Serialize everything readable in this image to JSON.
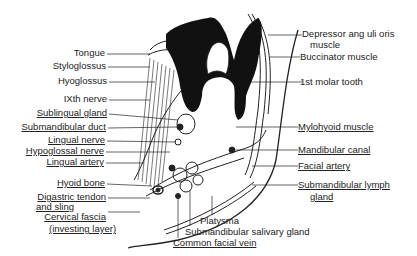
{
  "diagram": {
    "type": "anatomical cross-section",
    "labels_left": [
      {
        "id": "tongue",
        "text": "Tongue"
      },
      {
        "id": "styloglossus",
        "text": "Styloglossus"
      },
      {
        "id": "hyoglossus",
        "text": "Hyoglossus"
      },
      {
        "id": "ixth_nerve",
        "text": "IXth nerve"
      },
      {
        "id": "sublingual_gland",
        "text": "Sublingual gland"
      },
      {
        "id": "submandibular_duct",
        "text": "Submandibular duct"
      },
      {
        "id": "lingual_nerve",
        "text": "Lingual nerve"
      },
      {
        "id": "hypoglossal_nerve",
        "text": "Hypoglossal nerve"
      },
      {
        "id": "lingual_artery",
        "text": "Lingual artery"
      },
      {
        "id": "hyoid_bone",
        "text": "Hyoid bone"
      },
      {
        "id": "digastric_1",
        "text": "Digastric tendon"
      },
      {
        "id": "digastric_2",
        "text": "and sling"
      },
      {
        "id": "cervical_1",
        "text": "Cervical fascia"
      },
      {
        "id": "cervical_2",
        "text": "(investing layer)"
      }
    ],
    "labels_right": [
      {
        "id": "depressor_1",
        "text": "Depressor ang uli oris"
      },
      {
        "id": "depressor_2",
        "text": "muscle"
      },
      {
        "id": "buccinator",
        "text": "Buccinator muscle"
      },
      {
        "id": "molar",
        "text": "1st molar tooth"
      },
      {
        "id": "mylohyoid",
        "text": "Mylohyoid muscle"
      },
      {
        "id": "mandibular_canal",
        "text": "Mandibular canal"
      },
      {
        "id": "facial_artery",
        "text": "Facial artery"
      },
      {
        "id": "lymph_1",
        "text": "Submandibular lymph"
      },
      {
        "id": "lymph_2",
        "text": "gland"
      }
    ],
    "labels_bottom": [
      {
        "id": "platysma",
        "text": "Platysma"
      },
      {
        "id": "salivary",
        "text": "Submandibular salivary gland"
      },
      {
        "id": "facial_vein",
        "text": "Common facial vein"
      }
    ]
  }
}
